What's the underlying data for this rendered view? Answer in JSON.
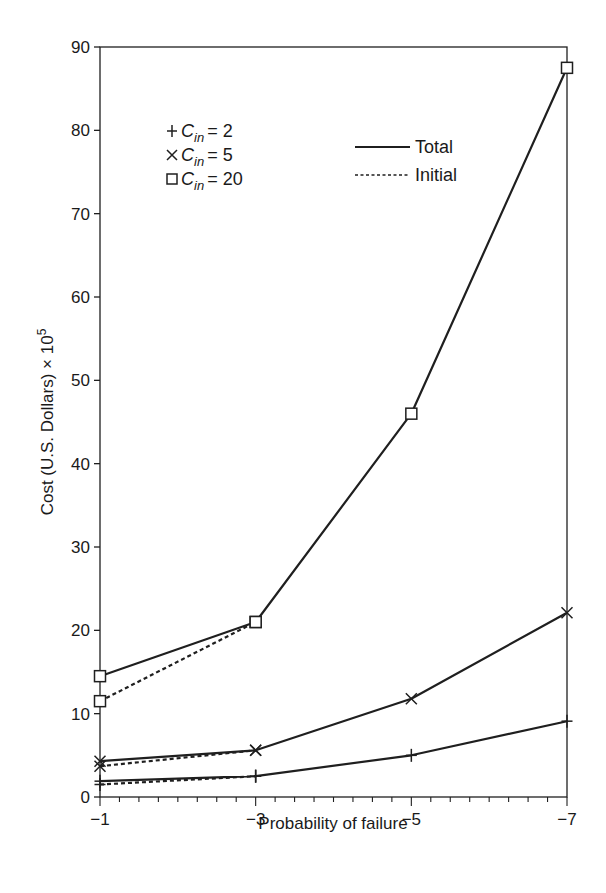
{
  "chart_data": {
    "type": "line",
    "title": "",
    "xlabel": "Probability of failure",
    "ylabel": "Cost (U.S. Dollars) × 10^5",
    "ylabel_main": "Cost (U.S. Dollars) × 10",
    "ylabel_exp": "5",
    "x": [
      -1,
      -3,
      -5,
      -7
    ],
    "x_tick_labels": [
      "−1",
      "−3",
      "−5",
      "−7"
    ],
    "ylim": [
      0,
      90
    ],
    "y_ticks": [
      0,
      10,
      20,
      30,
      40,
      50,
      60,
      70,
      80,
      90
    ],
    "grid": false,
    "series": [
      {
        "name": "Total, C_in = 2",
        "cin": "2",
        "style": "solid",
        "marker": "plus",
        "x": [
          -1,
          -3,
          -5,
          -7
        ],
        "values": [
          1.9,
          2.5,
          5.0,
          9.1
        ]
      },
      {
        "name": "Initial, C_in = 2",
        "cin": "2",
        "style": "dotted",
        "marker": "plus",
        "x": [
          -1,
          -3
        ],
        "values": [
          1.5,
          2.5
        ]
      },
      {
        "name": "Total, C_in = 5",
        "cin": "5",
        "style": "solid",
        "marker": "cross",
        "x": [
          -1,
          -3,
          -5,
          -7
        ],
        "values": [
          4.3,
          5.6,
          11.8,
          22.1
        ]
      },
      {
        "name": "Initial, C_in = 5",
        "cin": "5",
        "style": "dotted",
        "marker": "cross",
        "x": [
          -1,
          -3
        ],
        "values": [
          3.7,
          5.6
        ]
      },
      {
        "name": "Total, C_in = 20",
        "cin": "20",
        "style": "solid",
        "marker": "square",
        "x": [
          -1,
          -3,
          -5,
          -7
        ],
        "values": [
          14.5,
          21.0,
          46.0,
          87.5
        ]
      },
      {
        "name": "Initial, C_in = 20",
        "cin": "20",
        "style": "dotted",
        "marker": "square",
        "x": [
          -1,
          -3
        ],
        "values": [
          11.5,
          21.0
        ]
      }
    ],
    "legend": {
      "markers": [
        {
          "symbol": "plus",
          "label_var": "C",
          "label_sub": "in",
          "label_value": "= 2"
        },
        {
          "symbol": "cross",
          "label_var": "C",
          "label_sub": "in",
          "label_value": "= 5"
        },
        {
          "symbol": "square",
          "label_var": "C",
          "label_sub": "in",
          "label_value": "= 20"
        }
      ],
      "lines": [
        {
          "style": "solid",
          "label": "Total"
        },
        {
          "style": "dotted",
          "label": "Initial"
        }
      ],
      "position": "upper-left inside plot"
    }
  }
}
